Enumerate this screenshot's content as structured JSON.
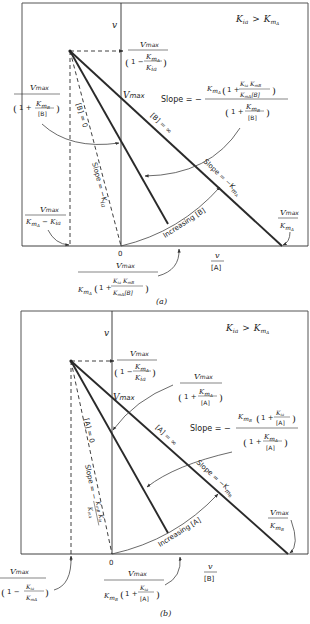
{
  "figure": {
    "panel_a": {
      "caption": "(a)",
      "condition": {
        "lhs": "K",
        "lhs_sub": "ia",
        "op": ">",
        "rhs": "K",
        "rhs_sub": "m",
        "rhs_subsub": "A"
      },
      "y_axis_label": "v",
      "x_axis_label_num": "v",
      "x_axis_label_den": "[A]",
      "origin_label": "0",
      "vmax_label": "V",
      "vmax_sub": "max",
      "line_labels": {
        "b_zero": "[B] = 0",
        "b_inf": "[B] = ∞",
        "slope_kia": "Slope = −K",
        "slope_kia_sub": "ia",
        "slope_kma": "Slope = −K",
        "slope_kma_sub": "m",
        "slope_kma_subsub": "A",
        "increasing": "Increasing [B]"
      },
      "annotations": {
        "top_intercept": {
          "num": "Vmax",
          "den": "(1 − KmA / Kia)"
        },
        "left_intercept": {
          "num": "Vmax",
          "den": "(1 + KmB / [B])"
        },
        "slope_general": {
          "prefix": "Slope = −",
          "num": "KmA (1 + Kia KmB / (KmA [B]))",
          "den": "(1 + KmB / [B])"
        },
        "x_neg_intercept": {
          "num": "Vmax",
          "den": "KmA − Kia"
        },
        "x_right_intercept": {
          "num": "Vmax",
          "den": "KmA"
        },
        "x_mid_intercept": {
          "num": "Vmax",
          "den": "KmA (1 + Kia KmB / (KmA [B]))"
        }
      }
    },
    "panel_b": {
      "caption": "(b)",
      "condition": {
        "lhs": "K",
        "lhs_sub": "ia",
        "op": ">",
        "rhs": "K",
        "rhs_sub": "m",
        "rhs_subsub": "A"
      },
      "y_axis_label": "v",
      "x_axis_label_num": "v",
      "x_axis_label_den": "[B]",
      "origin_label": "0",
      "vmax_label": "V",
      "vmax_sub": "max",
      "line_labels": {
        "a_zero": "[A] = 0",
        "a_inf": "[A] = ∞",
        "slope_dash": "Slope = −",
        "slope_dash_frac_num": "KmB Kia",
        "slope_dash_frac_den": "KmA",
        "slope_kmb": "Slope = −K",
        "slope_kmb_sub": "m",
        "slope_kmb_subsub": "B",
        "increasing": "Increasing [A]"
      },
      "annotations": {
        "top_intercept": {
          "num": "Vmax",
          "den": "(1 − KmA / Kia)"
        },
        "right_intercept": {
          "num": "Vmax",
          "den": "(1 + KmA / [A])"
        },
        "slope_general": {
          "prefix": "Slope = −",
          "num": "KmB (1 + Kia / [A])",
          "den": "(1 + KmA / [A])"
        },
        "x_neg_intercept": {
          "num": "Vmax",
          "den": "(1 − Kia / KmA)"
        },
        "x_right_intercept": {
          "num": "Vmax",
          "den": "KmB"
        },
        "x_mid_intercept": {
          "num": "Vmax",
          "den": "KmB (1 + Kia / [A])"
        }
      }
    }
  },
  "text": {
    "Vmax": "V",
    "max": "max",
    "K": "K",
    "m": "m",
    "ia": "ia",
    "A": "A",
    "B": "B",
    "one_plus": "1 +",
    "one_minus": "1 −",
    "lbrA": "[A]",
    "lbrB": "[B]",
    "eq_slope": "Slope = −",
    "minus": "−",
    "gt": ">"
  }
}
